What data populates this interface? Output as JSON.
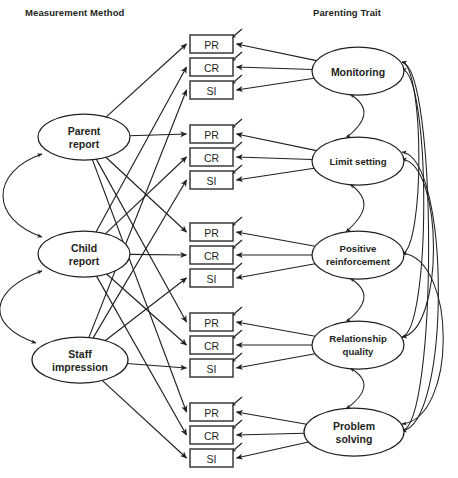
{
  "figure": {
    "type": "path-diagram",
    "model": "multitrait-multimethod confirmatory factor analysis",
    "headers": {
      "left": "Measurement Method",
      "right": "Parenting Trait"
    }
  },
  "methods": [
    {
      "id": "parent",
      "label_line1": "Parent",
      "label_line2": "report",
      "cx": 84,
      "cy": 137,
      "rx": 46,
      "ry": 23
    },
    {
      "id": "child",
      "label_line1": "Child",
      "label_line2": "report",
      "cx": 84,
      "cy": 254,
      "rx": 46,
      "ry": 23
    },
    {
      "id": "staff",
      "label_line1": "Staff",
      "label_line2": "impression",
      "cx": 80,
      "cy": 360,
      "rx": 48,
      "ry": 23
    }
  ],
  "traits": [
    {
      "id": "monitoring",
      "label_line1": "Monitoring",
      "label_line2": "",
      "cx": 358,
      "cy": 71,
      "rx": 46,
      "ry": 24
    },
    {
      "id": "limit",
      "label_line1": "Limit setting",
      "label_line2": "",
      "cx": 358,
      "cy": 161,
      "rx": 46,
      "ry": 24
    },
    {
      "id": "positive",
      "label_line1": "Positive",
      "label_line2": "reinforcement",
      "cx": 358,
      "cy": 255,
      "rx": 46,
      "ry": 24
    },
    {
      "id": "relationship",
      "label_line1": "Relationship",
      "label_line2": "quality",
      "cx": 358,
      "cy": 345,
      "rx": 46,
      "ry": 24
    },
    {
      "id": "problem",
      "label_line1": "Problem",
      "label_line2": "solving",
      "cx": 354,
      "cy": 432,
      "rx": 50,
      "ry": 24
    }
  ],
  "indicator_groups": [
    {
      "trait": "monitoring",
      "indicators": [
        {
          "label": "PR",
          "x": 190,
          "y": 35,
          "w": 43,
          "h": 18
        },
        {
          "label": "CR",
          "x": 190,
          "y": 58,
          "w": 43,
          "h": 18
        },
        {
          "label": "SI",
          "x": 190,
          "y": 81,
          "w": 43,
          "h": 18
        }
      ]
    },
    {
      "trait": "limit",
      "indicators": [
        {
          "label": "PR",
          "x": 190,
          "y": 125,
          "w": 43,
          "h": 18
        },
        {
          "label": "CR",
          "x": 190,
          "y": 148,
          "w": 43,
          "h": 18
        },
        {
          "label": "SI",
          "x": 190,
          "y": 171,
          "w": 43,
          "h": 18
        }
      ]
    },
    {
      "trait": "positive",
      "indicators": [
        {
          "label": "PR",
          "x": 190,
          "y": 223,
          "w": 43,
          "h": 18
        },
        {
          "label": "CR",
          "x": 190,
          "y": 246,
          "w": 43,
          "h": 18
        },
        {
          "label": "SI",
          "x": 190,
          "y": 269,
          "w": 43,
          "h": 18
        }
      ]
    },
    {
      "trait": "relationship",
      "indicators": [
        {
          "label": "PR",
          "x": 190,
          "y": 313,
          "w": 43,
          "h": 18
        },
        {
          "label": "CR",
          "x": 190,
          "y": 336,
          "w": 43,
          "h": 18
        },
        {
          "label": "SI",
          "x": 190,
          "y": 359,
          "w": 43,
          "h": 18
        }
      ]
    },
    {
      "trait": "problem",
      "indicators": [
        {
          "label": "PR",
          "x": 190,
          "y": 403,
          "w": 43,
          "h": 18
        },
        {
          "label": "CR",
          "x": 190,
          "y": 426,
          "w": 43,
          "h": 18
        },
        {
          "label": "SI",
          "x": 190,
          "y": 449,
          "w": 43,
          "h": 18
        }
      ]
    }
  ],
  "method_correlations": [
    {
      "from": "parent",
      "to": "child"
    },
    {
      "from": "child",
      "to": "staff"
    }
  ],
  "trait_correlations": [
    {
      "from": "monitoring",
      "to": "limit"
    },
    {
      "from": "limit",
      "to": "positive"
    },
    {
      "from": "positive",
      "to": "relationship"
    },
    {
      "from": "relationship",
      "to": "problem"
    },
    {
      "from": "monitoring",
      "to": "positive"
    },
    {
      "from": "monitoring",
      "to": "relationship"
    },
    {
      "from": "monitoring",
      "to": "problem"
    },
    {
      "from": "limit",
      "to": "relationship"
    },
    {
      "from": "limit",
      "to": "problem"
    },
    {
      "from": "positive",
      "to": "problem"
    }
  ],
  "colors": {
    "stroke": "#231f20",
    "box_stroke": "#3a3a3a",
    "fill": "#ffffff",
    "text": "#231f20"
  }
}
